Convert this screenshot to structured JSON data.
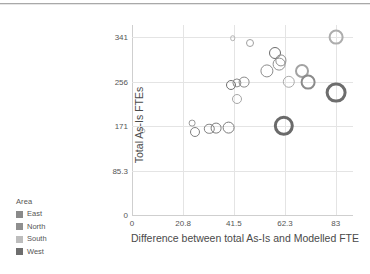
{
  "chart_data": {
    "type": "scatter",
    "title": "",
    "xlabel": "Difference between total As-Is and Modelled FTE",
    "ylabel": "Total As-Is FTEs",
    "xlim": [
      0,
      90
    ],
    "ylim": [
      0,
      365
    ],
    "xticks": [
      "0",
      "20.8",
      "41.5",
      "62.3",
      "83"
    ],
    "xtick_values": [
      0,
      20.8,
      41.5,
      62.3,
      83
    ],
    "yticks": [
      "0",
      "85.3",
      "171",
      "256",
      "341"
    ],
    "ytick_values": [
      0,
      85.3,
      171,
      256,
      341
    ],
    "grid": true,
    "legend_position": "left-outside",
    "size_encodes": "bubble area",
    "color_encodes": "Area",
    "points": [
      {
        "x": 4.2,
        "y": 162,
        "r": 2.6,
        "area": "South",
        "color": "#b9b9b9"
      },
      {
        "x": 24.4,
        "y": 177,
        "r": 3.4,
        "area": "South",
        "color": "#9a9a9a"
      },
      {
        "x": 25.8,
        "y": 159,
        "r": 5.0,
        "area": "North",
        "color": "#808080"
      },
      {
        "x": 31.5,
        "y": 166,
        "r": 5.2,
        "area": "North",
        "color": "#808080"
      },
      {
        "x": 34.4,
        "y": 167,
        "r": 5.4,
        "area": "North",
        "color": "#7d7d7d"
      },
      {
        "x": 39.3,
        "y": 168,
        "r": 6.4,
        "area": "North",
        "color": "#7b7b7b"
      },
      {
        "x": 41.0,
        "y": 340,
        "r": 2.8,
        "area": "South",
        "color": "#b4b4b4"
      },
      {
        "x": 40.2,
        "y": 249,
        "r": 5.0,
        "area": "West",
        "color": "#6f6f6f"
      },
      {
        "x": 42.6,
        "y": 253,
        "r": 4.6,
        "area": "North",
        "color": "#8a8a8a"
      },
      {
        "x": 45.8,
        "y": 255,
        "r": 5.4,
        "area": "North",
        "color": "#8a8a8a"
      },
      {
        "x": 42.8,
        "y": 222,
        "r": 5.0,
        "area": "South",
        "color": "#a6a6a6"
      },
      {
        "x": 48.2,
        "y": 330,
        "r": 4.0,
        "area": "South",
        "color": "#a0a0a0"
      },
      {
        "x": 55.0,
        "y": 277,
        "r": 6.6,
        "area": "North",
        "color": "#8c8c8c"
      },
      {
        "x": 58.4,
        "y": 312,
        "r": 6.0,
        "area": "West",
        "color": "#6c6c6c"
      },
      {
        "x": 60.0,
        "y": 290,
        "r": 6.4,
        "area": "North",
        "color": "#909090"
      },
      {
        "x": 60.6,
        "y": 297,
        "r": 5.6,
        "area": "North",
        "color": "#8e8e8e"
      },
      {
        "x": 61.8,
        "y": 171,
        "r": 10.2,
        "area": "West",
        "color": "#6a6a6a"
      },
      {
        "x": 63.8,
        "y": 256,
        "r": 6.2,
        "area": "South",
        "color": "#ababab"
      },
      {
        "x": 69.2,
        "y": 277,
        "r": 7.0,
        "area": "South",
        "color": "#a2a2a2"
      },
      {
        "x": 71.8,
        "y": 256,
        "r": 7.4,
        "area": "North",
        "color": "#8b8b8b"
      },
      {
        "x": 83.0,
        "y": 341,
        "r": 7.4,
        "area": "South",
        "color": "#adadad"
      },
      {
        "x": 83.0,
        "y": 235,
        "r": 10.4,
        "area": "West",
        "color": "#6d6d6d"
      }
    ]
  },
  "legend": {
    "title": "Area",
    "items": [
      {
        "label": "East",
        "color": "#8a8a8a"
      },
      {
        "label": "North",
        "color": "#8f8f8f"
      },
      {
        "label": "South",
        "color": "#bdbdbd"
      },
      {
        "label": "West",
        "color": "#6e6e6e"
      }
    ]
  }
}
